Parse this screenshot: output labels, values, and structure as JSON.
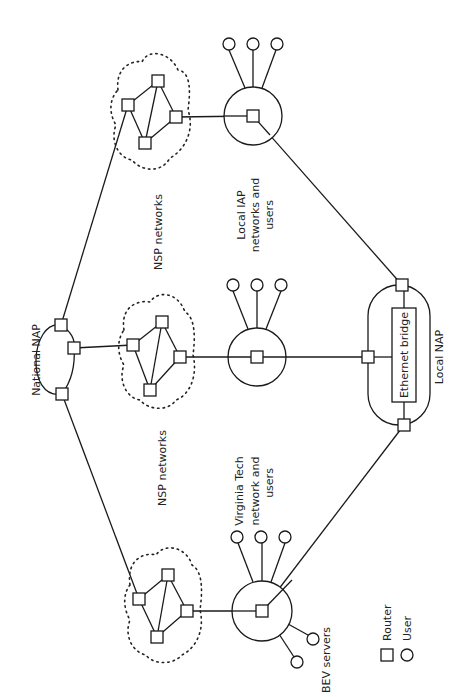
{
  "labels": {
    "national_nap": "National NAP",
    "nsp_top": "NSP networks",
    "nsp_bottom": "NSP networks",
    "local_iap": [
      "Local IAP",
      "networks and",
      "users"
    ],
    "virginia_tech": [
      "Virginia Tech",
      "network and",
      "users"
    ],
    "bev_servers": "BEV servers",
    "local_nap": "Local NAP",
    "ethernet_bridge": "Ethernet bridge"
  },
  "legend": {
    "router": "Router",
    "user": "User"
  },
  "colors": {
    "stroke": "#1a1a1a",
    "background": "#ffffff"
  }
}
